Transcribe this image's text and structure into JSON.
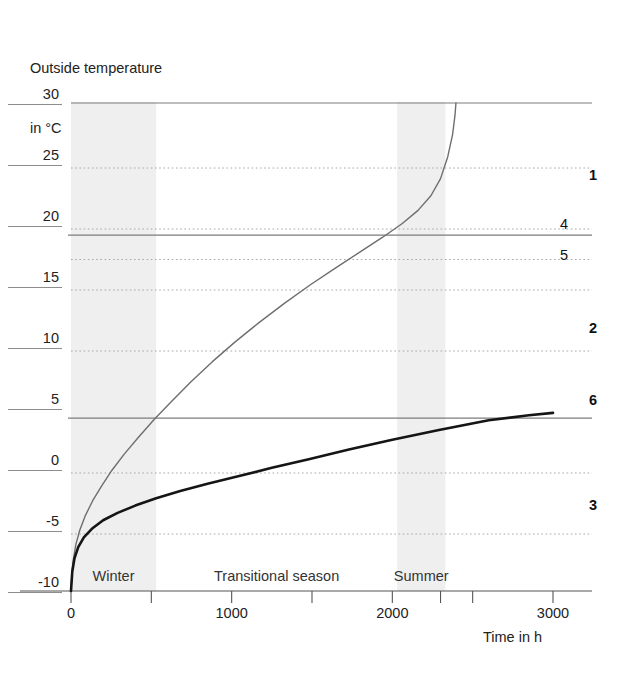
{
  "title": {
    "line1": "Outside temperature",
    "line2": "in °C"
  },
  "axis": {
    "x_caption": "Time in h"
  },
  "seasons": [
    {
      "label": "Winter",
      "x_start": 0,
      "x_end": 530
    },
    {
      "label": "Transitional season",
      "x_start": 530,
      "x_end": 2030
    },
    {
      "label": "Summer",
      "x_start": 2030,
      "x_end": 2330
    }
  ],
  "annotations": [
    {
      "label": "1",
      "bold": true,
      "value_y": 24.0
    },
    {
      "label": "4",
      "bold": false,
      "value_y": 20.0
    },
    {
      "label": "5",
      "bold": false,
      "value_y": 17.5
    },
    {
      "label": "2",
      "bold": true,
      "value_y": 11.5
    },
    {
      "label": "6",
      "bold": true,
      "value_y": 5.6
    },
    {
      "label": "3",
      "bold": true,
      "value_y": -3.0
    }
  ],
  "chart_data": {
    "type": "line",
    "title": "Outside temperature in °C",
    "xlabel": "Time in h",
    "ylabel": "Outside temperature in °C",
    "xlim": [
      0,
      3100
    ],
    "ylim": [
      -10,
      30
    ],
    "grid": true,
    "legend": "none",
    "xticks": [
      0,
      500,
      1000,
      1500,
      2000,
      2300,
      2500,
      3000
    ],
    "xtick_labels": [
      "0",
      "",
      "1000",
      "",
      "2000",
      "",
      "",
      "3000"
    ],
    "yticks": [
      -10,
      -5,
      0,
      5,
      10,
      15,
      20,
      25,
      30
    ],
    "ytick_labels": [
      "-10",
      "-5",
      "0",
      "5",
      "10",
      "15",
      "20",
      "25",
      "30"
    ],
    "gridlines_dotted": [
      -5,
      0,
      10,
      15,
      17.5,
      20,
      25
    ],
    "gridlines_solid": [
      30,
      19.5,
      4.5
    ],
    "series": [
      {
        "name": "upper-curve",
        "color": "#6e6e6e",
        "width": 1.4,
        "points": [
          [
            0,
            -10.0
          ],
          [
            5,
            -8.6
          ],
          [
            15,
            -7.4
          ],
          [
            30,
            -6.2
          ],
          [
            55,
            -5.0
          ],
          [
            90,
            -3.8
          ],
          [
            135,
            -2.6
          ],
          [
            190,
            -1.4
          ],
          [
            255,
            -0.1
          ],
          [
            330,
            1.2
          ],
          [
            420,
            2.6
          ],
          [
            520,
            4.1
          ],
          [
            630,
            5.6
          ],
          [
            750,
            7.2
          ],
          [
            880,
            8.8
          ],
          [
            1020,
            10.4
          ],
          [
            1170,
            12.0
          ],
          [
            1330,
            13.6
          ],
          [
            1490,
            15.1
          ],
          [
            1650,
            16.5
          ],
          [
            1800,
            17.8
          ],
          [
            1940,
            19.0
          ],
          [
            2060,
            20.1
          ],
          [
            2160,
            21.2
          ],
          [
            2240,
            22.4
          ],
          [
            2300,
            23.8
          ],
          [
            2345,
            25.6
          ],
          [
            2375,
            27.4
          ],
          [
            2390,
            29.0
          ],
          [
            2396,
            30.0
          ]
        ]
      },
      {
        "name": "lower-curve",
        "color": "#151515",
        "width": 2.6,
        "points": [
          [
            0,
            -10.0
          ],
          [
            8,
            -8.4
          ],
          [
            22,
            -7.3
          ],
          [
            45,
            -6.4
          ],
          [
            80,
            -5.6
          ],
          [
            130,
            -4.9
          ],
          [
            200,
            -4.2
          ],
          [
            290,
            -3.6
          ],
          [
            400,
            -3.0
          ],
          [
            530,
            -2.4
          ],
          [
            680,
            -1.8
          ],
          [
            850,
            -1.2
          ],
          [
            1040,
            -0.6
          ],
          [
            1250,
            0.1
          ],
          [
            1480,
            0.8
          ],
          [
            1730,
            1.6
          ],
          [
            2000,
            2.4
          ],
          [
            2290,
            3.2
          ],
          [
            2600,
            4.0
          ],
          [
            2850,
            4.4
          ],
          [
            3000,
            4.6
          ]
        ]
      }
    ],
    "shaded_bands": [
      {
        "name": "Winter",
        "x_start": 0,
        "x_end": 530,
        "color": "#eeeeee"
      },
      {
        "name": "Summer",
        "x_start": 2030,
        "x_end": 2330,
        "color": "#eeeeee"
      }
    ]
  },
  "colors": {
    "upper_curve": "#6e6e6e",
    "lower_curve": "#151515",
    "grid_dotted": "#a8a8a8",
    "grid_solid": "#7d7d7d",
    "axis": "#555555",
    "band": "#ededed"
  }
}
